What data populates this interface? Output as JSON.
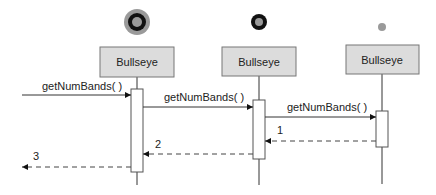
{
  "diagram": {
    "type": "sequence",
    "colors": {
      "box_fill": "#dcdcdc",
      "box_stroke": "#777777",
      "line": "#333333",
      "icon_gray": "#9a9a9a",
      "icon_black": "#111111"
    },
    "lifelines": [
      {
        "id": "obj1",
        "label": "Bullseye",
        "icon": "bullseye-large-icon"
      },
      {
        "id": "obj2",
        "label": "Bullseye",
        "icon": "bullseye-medium-icon"
      },
      {
        "id": "obj3",
        "label": "Bullseye",
        "icon": "bullseye-small-icon"
      }
    ],
    "messages": [
      {
        "from": "external",
        "to": "obj1",
        "label": "getNumBands( )",
        "kind": "call"
      },
      {
        "from": "obj1",
        "to": "obj2",
        "label": "getNumBands( )",
        "kind": "call"
      },
      {
        "from": "obj2",
        "to": "obj3",
        "label": "getNumBands( )",
        "kind": "call"
      },
      {
        "from": "obj3",
        "to": "obj2",
        "label": "1",
        "kind": "return"
      },
      {
        "from": "obj2",
        "to": "obj1",
        "label": "2",
        "kind": "return"
      },
      {
        "from": "obj1",
        "to": "external",
        "label": "3",
        "kind": "return"
      }
    ]
  }
}
